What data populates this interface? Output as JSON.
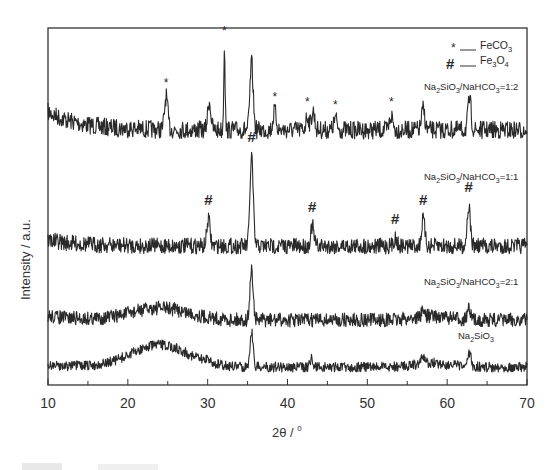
{
  "chart_data": {
    "type": "line",
    "title": "",
    "xlabel": "2θ / °",
    "ylabel": "Intensity / a.u.",
    "xlim": [
      10,
      70
    ],
    "xticks": [
      10,
      20,
      30,
      40,
      50,
      60,
      70
    ],
    "yticks": [],
    "grid": false,
    "legend": {
      "position": "top-right",
      "entries": [
        {
          "marker": "*",
          "label": "FeCO3"
        },
        {
          "marker": "#",
          "label": "Fe3O4"
        }
      ]
    },
    "series": [
      {
        "name": "Na2SiO3/NaHCO3=1:2",
        "offset_rank": 4,
        "peaks_2theta": [
          24.8,
          30.2,
          32.1,
          35.5,
          38.4,
          42.5,
          43.2,
          46.0,
          53.0,
          57.0,
          62.8
        ],
        "peak_rel_intensity": [
          0.35,
          0.3,
          0.9,
          0.7,
          0.2,
          0.15,
          0.2,
          0.12,
          0.15,
          0.22,
          0.32
        ],
        "markers": [
          {
            "x": 24.8,
            "symbol": "*"
          },
          {
            "x": 32.1,
            "symbol": "*"
          },
          {
            "x": 38.4,
            "symbol": "*"
          },
          {
            "x": 42.5,
            "symbol": "*"
          },
          {
            "x": 46.0,
            "symbol": "*"
          },
          {
            "x": 53.0,
            "symbol": "*"
          }
        ]
      },
      {
        "name": "Na2SiO3/NaHCO3=1:1",
        "offset_rank": 3,
        "peaks_2theta": [
          30.1,
          35.5,
          43.1,
          53.5,
          57.0,
          62.7
        ],
        "peak_rel_intensity": [
          0.27,
          0.9,
          0.2,
          0.08,
          0.27,
          0.4
        ],
        "markers": [
          {
            "x": 30.1,
            "symbol": "#"
          },
          {
            "x": 35.5,
            "symbol": "#"
          },
          {
            "x": 43.1,
            "symbol": "#"
          },
          {
            "x": 53.5,
            "symbol": "#"
          },
          {
            "x": 57.0,
            "symbol": "#"
          },
          {
            "x": 62.7,
            "symbol": "#"
          }
        ]
      },
      {
        "name": "Na2SiO3/NaHCO3=2:1",
        "offset_rank": 2,
        "peaks_2theta": [
          35.5,
          57.0,
          62.7
        ],
        "peak_rel_intensity": [
          0.5,
          0.06,
          0.1
        ],
        "broad_hump_center": 24
      },
      {
        "name": "Na2SiO3",
        "offset_rank": 1,
        "peaks_2theta": [
          30.0,
          35.5,
          43.0,
          57.0,
          62.8
        ],
        "peak_rel_intensity": [
          0.05,
          0.35,
          0.08,
          0.07,
          0.13
        ],
        "broad_hump_center": 24
      }
    ]
  },
  "labels": {
    "xlabel": "2θ / ",
    "xlabel_deg": "0",
    "ylabel": "Intensity / a.u.",
    "legend_star": "*",
    "legend_hash": "#",
    "legend_dash": "—",
    "legend_feco3_main": "FeCO",
    "legend_feco3_sub": "3",
    "legend_fe3o4_a": "Fe",
    "legend_fe3o4_sub1": "3",
    "legend_fe3o4_b": "O",
    "legend_fe3o4_sub2": "4",
    "series_12": "Na2SiO3/NaHCO3=1:2",
    "series_11": "Na2SiO3/NaHCO3=1:1",
    "series_21": "Na2SiO3/NaHCO3=2:1",
    "series_0": "Na2SiO3",
    "ticks": [
      "10",
      "20",
      "30",
      "40",
      "50",
      "60",
      "70"
    ]
  },
  "colors": {
    "line": "#2a2a2a",
    "axis": "#333333",
    "background": "#ffffff"
  }
}
